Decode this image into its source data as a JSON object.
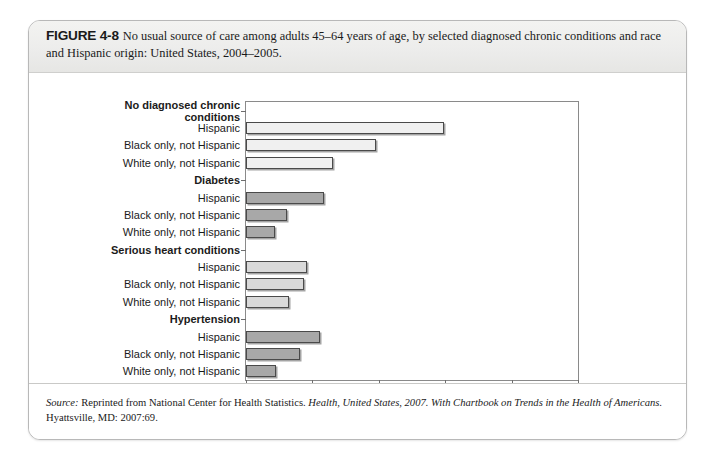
{
  "figure": {
    "label": "FIGURE 4-8",
    "caption": "No usual source of care among adults 45–64 years of age, by selected diagnosed chronic conditions and race and Hispanic origin: United States, 2004–2005."
  },
  "source": {
    "lead": "Source:",
    "part1": " Reprinted from National Center for Health Statistics. ",
    "italic1": "Health, United States, 2007. With Chartbook on Trends in the Health of Americans.",
    "part2": " Hyattsville, MD: 2007:69."
  },
  "chart_data": {
    "type": "bar",
    "orientation": "horizontal",
    "title": "",
    "xlabel": "Percent",
    "ylabel": "",
    "xlim": [
      0,
      50
    ],
    "xticks": [
      0,
      10,
      20,
      30,
      40,
      50
    ],
    "grid": false,
    "legend": "none",
    "groups": [
      {
        "name": "No diagnosed chronic conditions",
        "fill": "#f0f0f0",
        "bars": [
          {
            "label": "Hispanic",
            "value": 29.8
          },
          {
            "label": "Black only, not Hispanic",
            "value": 19.6
          },
          {
            "label": "White only, not Hispanic",
            "value": 13.1
          }
        ]
      },
      {
        "name": "Diabetes",
        "fill": "#a8a8a8",
        "bars": [
          {
            "label": "Hispanic",
            "value": 11.8
          },
          {
            "label": "Black only, not Hispanic",
            "value": 6.2
          },
          {
            "label": "White only, not Hispanic",
            "value": 4.4
          }
        ]
      },
      {
        "name": "Serious heart conditions",
        "fill": "#d9d9d9",
        "bars": [
          {
            "label": "Hispanic",
            "value": 9.2
          },
          {
            "label": "Black only, not Hispanic",
            "value": 8.7
          },
          {
            "label": "White only, not Hispanic",
            "value": 6.5
          }
        ]
      },
      {
        "name": "Hypertension",
        "fill": "#a8a8a8",
        "bars": [
          {
            "label": "Hispanic",
            "value": 11.1
          },
          {
            "label": "Black only, not Hispanic",
            "value": 8.1
          },
          {
            "label": "White only, not Hispanic",
            "value": 4.5
          }
        ]
      }
    ]
  },
  "colors": {
    "card_border": "#b8b8b8",
    "axis": "#8a8a8a",
    "bar_outline": "#4a4a4a"
  }
}
